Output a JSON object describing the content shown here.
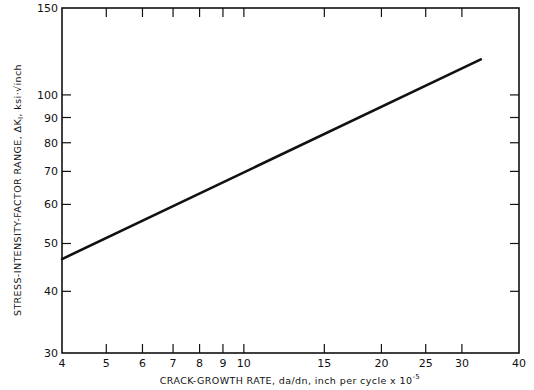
{
  "chart_data": {
    "type": "line",
    "title": "",
    "xlabel": "CRACK-GROWTH RATE, da/dn, inch per cycle x 10^-5",
    "xlabel_main": "CRACK-GROWTH RATE, da/dn, inch per cycle x 10",
    "xlabel_exp": "-5",
    "ylabel": "STRESS-INTENSITY-FACTOR RANGE, ΔK_I, ksi√inch",
    "ylabel_main": "STRESS-INTENSITY-FACTOR RANGE, ΔK",
    "ylabel_sub": "I",
    "ylabel_unit": ", ksi·√inch",
    "x_scale": "log",
    "y_scale": "log",
    "xlim": [
      4,
      40
    ],
    "ylim": [
      30,
      150
    ],
    "x_ticks": [
      4,
      5,
      6,
      7,
      8,
      9,
      10,
      15,
      20,
      25,
      30,
      40
    ],
    "y_ticks": [
      30,
      40,
      50,
      60,
      70,
      80,
      90,
      100,
      150
    ],
    "grid": false,
    "legend": null,
    "series": [
      {
        "name": "ΔK vs da/dn",
        "x": [
          4,
          33
        ],
        "y": [
          46.5,
          118
        ]
      }
    ]
  }
}
